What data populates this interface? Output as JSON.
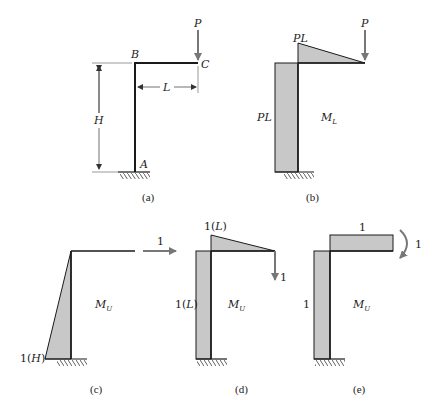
{
  "figure": {
    "panels": [
      {
        "id": "a",
        "caption": "(a)",
        "labels": {
          "top_corner": "B",
          "tip": "C",
          "base": "A",
          "height": "H",
          "length": "L",
          "load": "P"
        }
      },
      {
        "id": "b",
        "caption": "(b)",
        "labels": {
          "beam_moment": "PL",
          "column_moment": "PL",
          "diagram": "M",
          "diagram_sub": "L",
          "load": "P"
        }
      },
      {
        "id": "c",
        "caption": "(c)",
        "labels": {
          "base_moment": "1(H)",
          "diagram": "M",
          "diagram_sub": "U",
          "unit_load": "1"
        }
      },
      {
        "id": "d",
        "caption": "(d)",
        "labels": {
          "beam_moment": "1(L)",
          "column_moment": "1(L)",
          "diagram": "M",
          "diagram_sub": "U",
          "unit_load": "1"
        }
      },
      {
        "id": "e",
        "caption": "(e)",
        "labels": {
          "beam_moment": "1",
          "column_moment": "1",
          "diagram": "M",
          "diagram_sub": "U",
          "unit_moment": "1"
        }
      }
    ],
    "colors": {
      "fill": "#c8c8c8",
      "line": "#1a1a1a",
      "arrow": "#777777"
    }
  }
}
